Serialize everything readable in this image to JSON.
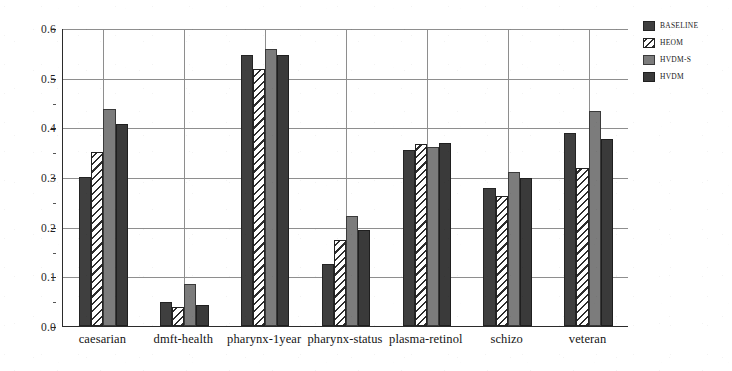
{
  "chart_data": {
    "type": "bar",
    "title": "",
    "xlabel": "",
    "ylabel": "",
    "ylim": [
      0.0,
      0.6
    ],
    "yticks": [
      "0.0",
      "0.1",
      "0.2",
      "0.3",
      "0.4",
      "0.5",
      "0.6"
    ],
    "grid": true,
    "legend_position": "top-right",
    "categories": [
      "caesarian",
      "dmft-health",
      "pharynx-1year",
      "pharynx-status",
      "plasma-retinol",
      "schizo",
      "veteran"
    ],
    "series": [
      {
        "name": "BASELINE",
        "style": "solid-dark-gray",
        "color": "#3f3f3f",
        "values": [
          0.3,
          0.049,
          0.545,
          0.125,
          0.354,
          0.277,
          0.389
        ]
      },
      {
        "name": "HEOM",
        "style": "diagonal-hatch",
        "color": "#ffffff",
        "values": [
          0.35,
          0.038,
          0.518,
          0.173,
          0.366,
          0.262,
          0.318
        ]
      },
      {
        "name": "HVDM-S",
        "style": "solid-medium-gray",
        "color": "#7c7c7c",
        "values": [
          0.437,
          0.084,
          0.557,
          0.221,
          0.36,
          0.31,
          0.432
        ]
      },
      {
        "name": "HVDM",
        "style": "solid-dark-gray",
        "color": "#3a3a3a",
        "values": [
          0.406,
          0.042,
          0.545,
          0.194,
          0.369,
          0.299,
          0.377
        ]
      }
    ]
  }
}
